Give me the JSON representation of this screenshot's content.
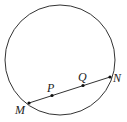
{
  "diagram": {
    "type": "geometry",
    "circle": {
      "cx": 60,
      "cy": 60,
      "r": 55
    },
    "chord": {
      "from": "M",
      "to": "N"
    },
    "points": [
      {
        "id": "M",
        "label": "M",
        "x": 29,
        "y": 103,
        "label_x": 15,
        "label_y": 114
      },
      {
        "id": "P",
        "label": "P",
        "x": 52,
        "y": 95.5,
        "label_x": 47,
        "label_y": 92
      },
      {
        "id": "Q",
        "label": "Q",
        "x": 83,
        "y": 85.5,
        "label_x": 78,
        "label_y": 81
      },
      {
        "id": "N",
        "label": "N",
        "x": 110,
        "y": 77,
        "label_x": 113,
        "label_y": 82
      }
    ],
    "colors": {
      "stroke": "#333333",
      "point": "#111111"
    }
  }
}
